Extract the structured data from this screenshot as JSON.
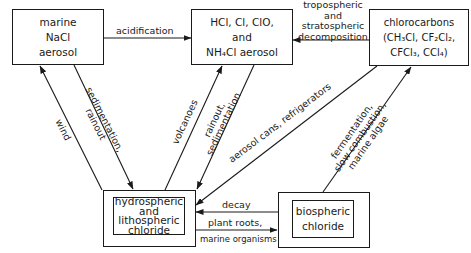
{
  "diagram": {
    "type": "chlorine cycle flow diagram",
    "nodes": {
      "marine": {
        "lines": [
          "marine",
          "NaCl",
          "aerosol"
        ]
      },
      "hcl": {
        "lines": [
          "HCl, Cl, ClO,",
          "and",
          "NH₄Cl aerosol"
        ]
      },
      "chlorocarbons": {
        "lines": [
          "chlorocarbons",
          "(CH₃Cl, CF₂Cl₂,",
          "CFCl₃, CCl₄)"
        ]
      },
      "hydrospheric": {
        "lines": [
          "hydrospheric",
          "and",
          "lithospheric",
          "chloride"
        ]
      },
      "biospheric": {
        "lines": [
          "biospheric",
          "chloride"
        ]
      }
    },
    "edges": [
      {
        "from": "marine",
        "to": "hcl",
        "label": "acidification"
      },
      {
        "from": "chlorocarbons",
        "to": "hcl",
        "label_lines": [
          "tropospheric",
          "and",
          "stratospheric",
          "decomposition"
        ]
      },
      {
        "from": "hydrospheric",
        "to": "marine",
        "label": "wind"
      },
      {
        "from": "marine",
        "to": "hydrospheric",
        "label_lines": [
          "sedimentation,",
          "rainout"
        ]
      },
      {
        "from": "hydrospheric",
        "to": "hcl",
        "label": "volcanoes"
      },
      {
        "from": "hcl",
        "to": "hydrospheric",
        "label_lines": [
          "rainout,",
          "sedimentation"
        ]
      },
      {
        "from": "chlorocarbons",
        "to": "hydrospheric",
        "label": "aerosol cans, refrigerators"
      },
      {
        "from": "biospheric",
        "to": "chlorocarbons",
        "label_lines": [
          "fermentation,",
          "slow combustion,",
          "marine algae"
        ]
      },
      {
        "from": "biospheric",
        "to": "hydrospheric",
        "label": "decay"
      },
      {
        "from": "hydrospheric",
        "to": "biospheric",
        "label_lines": [
          "plant roots,",
          "marine organisms"
        ]
      }
    ]
  }
}
